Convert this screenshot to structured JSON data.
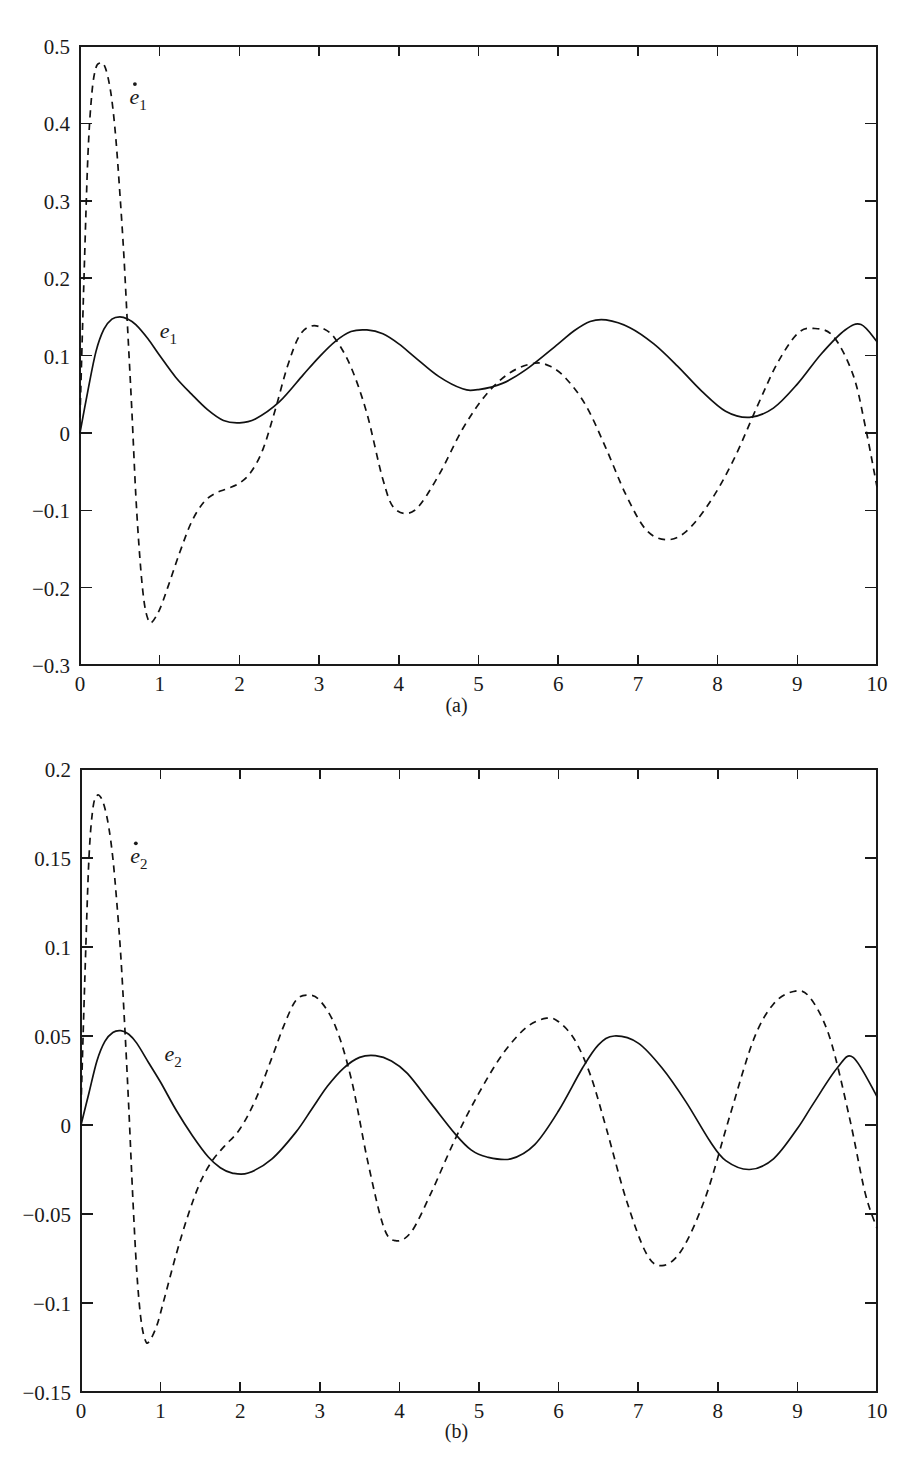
{
  "figure": {
    "panel_a_caption": "(a)",
    "panel_b_caption": "(b)"
  },
  "chart_data": [
    {
      "id": "panel-a",
      "type": "line",
      "title": "",
      "xlabel": "",
      "ylabel": "",
      "xlim": [
        0,
        10
      ],
      "ylim": [
        -0.3,
        0.5
      ],
      "grid": false,
      "legend_position": "inline-annotation",
      "xticks": [
        0,
        1,
        2,
        3,
        4,
        5,
        6,
        7,
        8,
        9,
        10
      ],
      "xticklabels": [
        "0",
        "1",
        "2",
        "3",
        "4",
        "5",
        "6",
        "7",
        "8",
        "9",
        "10"
      ],
      "yticks": [
        -0.3,
        -0.2,
        -0.1,
        0,
        0.1,
        0.2,
        0.3,
        0.4,
        0.5
      ],
      "yticklabels": [
        "−0.3",
        "−0.2",
        "−0.1",
        "0",
        "0.1",
        "0.2",
        "0.3",
        "0.4",
        "0.5"
      ],
      "annotations": [
        {
          "text": "e",
          "sub": "1",
          "dot": true,
          "x": 0.62,
          "y": 0.425
        },
        {
          "text": "e",
          "sub": "1",
          "dot": false,
          "x": 1.0,
          "y": 0.123
        }
      ],
      "series": [
        {
          "name": "e1",
          "style": "solid",
          "x": [
            0,
            0.1,
            0.2,
            0.3,
            0.4,
            0.5,
            0.6,
            0.7,
            0.85,
            1.0,
            1.2,
            1.4,
            1.6,
            1.8,
            2.0,
            2.2,
            2.5,
            2.8,
            3.0,
            3.2,
            3.4,
            3.6,
            3.8,
            4.0,
            4.2,
            4.5,
            4.8,
            5.0,
            5.3,
            5.6,
            6.0,
            6.2,
            6.4,
            6.6,
            6.9,
            7.2,
            7.5,
            7.8,
            8.1,
            8.4,
            8.7,
            9.0,
            9.3,
            9.6,
            9.8,
            10.0
          ],
          "y": [
            0.0,
            0.055,
            0.105,
            0.134,
            0.147,
            0.15,
            0.147,
            0.14,
            0.122,
            0.1,
            0.072,
            0.05,
            0.03,
            0.016,
            0.013,
            0.018,
            0.04,
            0.075,
            0.098,
            0.118,
            0.131,
            0.133,
            0.128,
            0.115,
            0.098,
            0.073,
            0.057,
            0.056,
            0.064,
            0.082,
            0.115,
            0.132,
            0.144,
            0.146,
            0.136,
            0.115,
            0.086,
            0.054,
            0.028,
            0.02,
            0.032,
            0.063,
            0.102,
            0.133,
            0.14,
            0.118
          ]
        },
        {
          "name": "e1dot",
          "style": "dashed",
          "x": [
            0,
            0.05,
            0.1,
            0.15,
            0.2,
            0.25,
            0.3,
            0.35,
            0.4,
            0.45,
            0.5,
            0.55,
            0.6,
            0.65,
            0.7,
            0.75,
            0.8,
            0.85,
            0.9,
            1.0,
            1.1,
            1.25,
            1.4,
            1.55,
            1.7,
            1.85,
            2.0,
            2.15,
            2.3,
            2.45,
            2.6,
            2.75,
            2.9,
            3.05,
            3.2,
            3.4,
            3.6,
            3.8,
            3.95,
            4.2,
            4.5,
            4.8,
            5.1,
            5.4,
            5.7,
            5.9,
            6.1,
            6.35,
            6.6,
            6.85,
            7.1,
            7.35,
            7.6,
            7.9,
            8.2,
            8.5,
            8.75,
            9.0,
            9.2,
            9.45,
            9.7,
            9.85,
            10.0
          ],
          "y": [
            0.02,
            0.2,
            0.36,
            0.44,
            0.472,
            0.478,
            0.476,
            0.46,
            0.43,
            0.38,
            0.31,
            0.23,
            0.13,
            0.03,
            -0.08,
            -0.16,
            -0.215,
            -0.24,
            -0.245,
            -0.228,
            -0.2,
            -0.155,
            -0.115,
            -0.09,
            -0.078,
            -0.072,
            -0.065,
            -0.05,
            -0.02,
            0.03,
            0.085,
            0.125,
            0.138,
            0.135,
            0.122,
            0.085,
            0.025,
            -0.06,
            -0.098,
            -0.1,
            -0.055,
            0.005,
            0.05,
            0.078,
            0.09,
            0.086,
            0.07,
            0.035,
            -0.02,
            -0.08,
            -0.125,
            -0.138,
            -0.128,
            -0.09,
            -0.035,
            0.035,
            0.09,
            0.128,
            0.135,
            0.125,
            0.075,
            0.01,
            -0.07
          ]
        }
      ]
    },
    {
      "id": "panel-b",
      "type": "line",
      "title": "",
      "xlabel": "",
      "ylabel": "",
      "xlim": [
        0,
        10
      ],
      "ylim": [
        -0.15,
        0.2
      ],
      "grid": false,
      "legend_position": "inline-annotation",
      "xticks": [
        0,
        1,
        2,
        3,
        4,
        5,
        6,
        7,
        8,
        9,
        10
      ],
      "xticklabels": [
        "0",
        "1",
        "2",
        "3",
        "4",
        "5",
        "6",
        "7",
        "8",
        "9",
        "10"
      ],
      "yticks": [
        -0.15,
        -0.1,
        -0.05,
        0,
        0.05,
        0.1,
        0.15,
        0.2
      ],
      "yticklabels": [
        "−0.15",
        "−0.1",
        "−0.05",
        "0",
        "0.05",
        "0.1",
        "0.15",
        "0.2"
      ],
      "annotations": [
        {
          "text": "e",
          "sub": "2",
          "dot": true,
          "x": 0.62,
          "y": 0.147
        },
        {
          "text": "e",
          "sub": "2",
          "dot": false,
          "x": 1.05,
          "y": 0.036
        }
      ],
      "series": [
        {
          "name": "e2",
          "style": "solid",
          "x": [
            0,
            0.1,
            0.2,
            0.3,
            0.4,
            0.5,
            0.6,
            0.7,
            0.85,
            1.0,
            1.2,
            1.4,
            1.6,
            1.75,
            1.9,
            2.1,
            2.4,
            2.7,
            2.9,
            3.1,
            3.3,
            3.5,
            3.7,
            3.9,
            4.1,
            4.4,
            4.7,
            4.9,
            5.1,
            5.4,
            5.7,
            6.0,
            6.3,
            6.5,
            6.7,
            7.0,
            7.3,
            7.6,
            7.9,
            8.1,
            8.4,
            8.7,
            9.0,
            9.2,
            9.5,
            9.7,
            10.0
          ],
          "y": [
            0.0,
            0.018,
            0.036,
            0.047,
            0.052,
            0.053,
            0.051,
            0.046,
            0.035,
            0.024,
            0.008,
            -0.006,
            -0.018,
            -0.024,
            -0.027,
            -0.027,
            -0.019,
            -0.004,
            0.009,
            0.022,
            0.032,
            0.038,
            0.039,
            0.036,
            0.029,
            0.012,
            -0.005,
            -0.014,
            -0.018,
            -0.019,
            -0.011,
            0.008,
            0.032,
            0.045,
            0.05,
            0.046,
            0.032,
            0.013,
            -0.009,
            -0.02,
            -0.025,
            -0.019,
            -0.002,
            0.012,
            0.032,
            0.038,
            0.016
          ]
        },
        {
          "name": "e2dot",
          "style": "dashed",
          "x": [
            0,
            0.05,
            0.1,
            0.15,
            0.2,
            0.25,
            0.3,
            0.35,
            0.4,
            0.45,
            0.5,
            0.55,
            0.6,
            0.65,
            0.7,
            0.75,
            0.8,
            0.85,
            0.95,
            1.05,
            1.2,
            1.35,
            1.5,
            1.65,
            1.8,
            2.0,
            2.2,
            2.4,
            2.55,
            2.7,
            2.85,
            3.0,
            3.2,
            3.4,
            3.6,
            3.8,
            3.95,
            4.15,
            4.4,
            4.7,
            5.0,
            5.3,
            5.6,
            5.85,
            6.0,
            6.2,
            6.4,
            6.6,
            6.85,
            7.1,
            7.3,
            7.55,
            7.85,
            8.15,
            8.45,
            8.7,
            8.95,
            9.15,
            9.4,
            9.65,
            9.85,
            10.0
          ],
          "y": [
            0.01,
            0.085,
            0.15,
            0.178,
            0.185,
            0.184,
            0.178,
            0.167,
            0.15,
            0.125,
            0.095,
            0.055,
            0.01,
            -0.04,
            -0.082,
            -0.108,
            -0.12,
            -0.122,
            -0.113,
            -0.097,
            -0.072,
            -0.05,
            -0.032,
            -0.02,
            -0.012,
            -0.002,
            0.015,
            0.038,
            0.056,
            0.07,
            0.073,
            0.07,
            0.055,
            0.025,
            -0.02,
            -0.057,
            -0.065,
            -0.06,
            -0.038,
            -0.008,
            0.018,
            0.04,
            0.055,
            0.06,
            0.058,
            0.048,
            0.028,
            -0.002,
            -0.042,
            -0.072,
            -0.079,
            -0.07,
            -0.04,
            0.005,
            0.048,
            0.068,
            0.075,
            0.072,
            0.05,
            0.005,
            -0.038,
            -0.058
          ]
        }
      ]
    }
  ]
}
